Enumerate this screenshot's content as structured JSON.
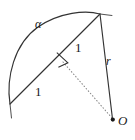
{
  "figure": {
    "background_color": "#ffffff",
    "stroke_color": "#333333",
    "label_color": "#1a1a1a",
    "width": 135,
    "height": 140,
    "labels": {
      "angle_alpha": "α",
      "chord_half_upper": "1",
      "chord_half_lower": "1",
      "radius": "r",
      "center_point": "O"
    },
    "points": {
      "apex": {
        "x": 100,
        "y": 14
      },
      "chord_start": {
        "x": 10,
        "y": 104
      },
      "midpoint": {
        "x": 62,
        "y": 60
      },
      "center_o": {
        "x": 113,
        "y": 120
      }
    },
    "elements": [
      {
        "name": "arc",
        "kind": "curve",
        "stroke": "#333333",
        "style": "solid"
      },
      {
        "name": "chord",
        "kind": "line",
        "stroke": "#333333",
        "style": "solid"
      },
      {
        "name": "radius-line",
        "kind": "line",
        "stroke": "#333333",
        "style": "solid"
      },
      {
        "name": "apothem-line",
        "kind": "line",
        "stroke": "#777777",
        "style": "dotted"
      },
      {
        "name": "right-angle-mark",
        "kind": "square",
        "stroke": "#333333",
        "style": "solid"
      },
      {
        "name": "center-dot",
        "kind": "dot",
        "fill": "#1a1a1a"
      },
      {
        "name": "apex-tick",
        "kind": "tick",
        "stroke": "#555555"
      },
      {
        "name": "chord-start-tick",
        "kind": "tick",
        "stroke": "#555555"
      }
    ]
  }
}
